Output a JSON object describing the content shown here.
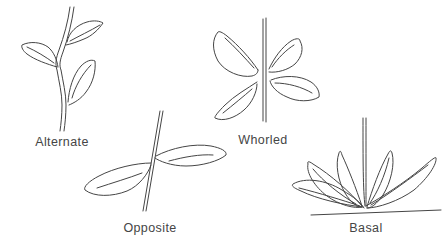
{
  "canvas": {
    "width": 448,
    "height": 248,
    "background": "#ffffff"
  },
  "style": {
    "line_color": "#454545",
    "label_color": "#454545"
  },
  "figures": [
    {
      "id": "alternate",
      "label": "Alternate"
    },
    {
      "id": "whorled",
      "label": "Whorled"
    },
    {
      "id": "opposite",
      "label": "Opposite"
    },
    {
      "id": "basal",
      "label": "Basal"
    }
  ]
}
